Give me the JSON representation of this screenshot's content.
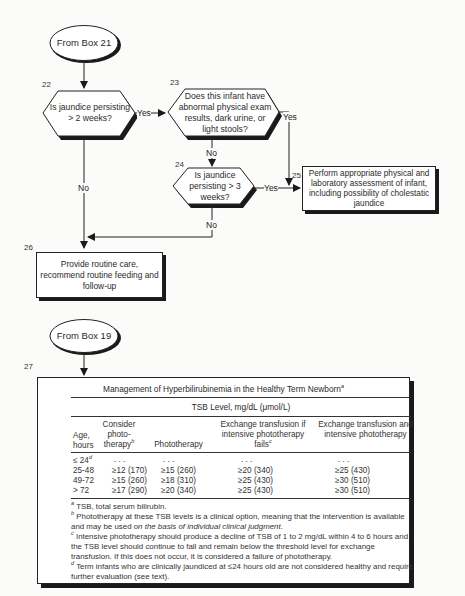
{
  "flowchart": {
    "start1": {
      "label": "From Box 21"
    },
    "node22": {
      "number": "22",
      "text": "Is jaundice persisting > 2 weeks?"
    },
    "node23": {
      "number": "23",
      "text": "Does this infant have abnormal physical exam results, dark urine, or light stools?"
    },
    "node24": {
      "number": "24",
      "text": "Is jaundice persisting > 3 weeks?"
    },
    "node25": {
      "number": "25",
      "text": "Perform appropriate physical and laboratory assessment of infant, including possibility of cholestatic jaundice"
    },
    "node26": {
      "number": "26",
      "text": "Provide routine care, recommend routine feeding and follow-up"
    },
    "start2": {
      "label": "From Box 19"
    },
    "node27": {
      "number": "27"
    },
    "edge_labels": {
      "yes": "Yes",
      "no": "No"
    }
  },
  "table": {
    "title": "Management of Hyperbilirubinemia in the Healthy Term Newborn",
    "title_sup": "a",
    "subheader": "TSB Level, mg/dL (μmol/L)",
    "columns": [
      {
        "label": "Age, hours",
        "sup": ""
      },
      {
        "label": "Consider photo-therapy",
        "sup": "b"
      },
      {
        "label": "Phototherapy",
        "sup": ""
      },
      {
        "label": "Exchange transfusion if intensive phototherapy fails",
        "sup": "c"
      },
      {
        "label": "Exchange transfusion and intensive phototherapy",
        "sup": ""
      }
    ],
    "rows": [
      {
        "age": "≤ 24",
        "age_sup": "d",
        "consider": ". . .",
        "photo": ". . .",
        "exchange_if_fails": ". . .",
        "exchange_and_intensive": ". . ."
      },
      {
        "age": "25-48",
        "age_sup": "",
        "consider": "≥12 (170)",
        "photo": "≥15 (260)",
        "exchange_if_fails": "≥20 (340)",
        "exchange_and_intensive": "≥25 (430)"
      },
      {
        "age": "49-72",
        "age_sup": "",
        "consider": "≥15 (260)",
        "photo": "≥18 (310)",
        "exchange_if_fails": "≥25 (430)",
        "exchange_and_intensive": "≥30 (510)"
      },
      {
        "age": "> 72",
        "age_sup": "",
        "consider": "≥17 (290)",
        "photo": "≥20 (340)",
        "exchange_if_fails": "≥25 (430)",
        "exchange_and_intensive": "≥30 (510)"
      }
    ],
    "footnotes": [
      {
        "mark": "a",
        "text": "TSB, total serum bilirubin."
      },
      {
        "mark": "b",
        "text": "Phototherapy at these TSB levels is a clinical option, meaning that the intervention is available and may be used ",
        "italic": "on the basis of individual clinical judgment",
        "tail": "."
      },
      {
        "mark": "c",
        "text": "Intensive phototherapy should produce a decline of TSB of 1 to 2 mg/dL within 4 to 6 hours and the TSB level should continue to fall and remain below the threshold level for exchange transfusion. If this does not occur, it is considered a failure of phototherapy."
      },
      {
        "mark": "d",
        "text": "Term infants who are clinically jaundiced at ≤24 hours old are not considered healthy and require further evaluation (see text)."
      }
    ]
  }
}
